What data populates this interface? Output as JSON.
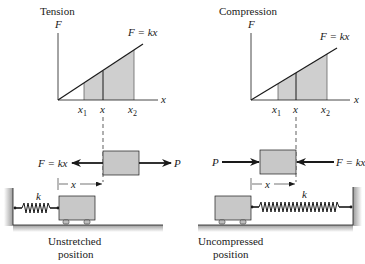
{
  "panels": [
    {
      "title": "Tension",
      "graph": {
        "y_axis_label": "F",
        "x_axis_label": "x",
        "line_label": "F = kx",
        "ticks": [
          "x",
          "x",
          "x"
        ],
        "tick_subscripts": [
          "1",
          "",
          "2"
        ]
      },
      "free_body": {
        "left_force_label": "F = kx",
        "right_force_label": "P",
        "displacement_label": "x"
      },
      "spring_label": "k",
      "caption_line1": "Unstretched",
      "caption_line2": "position"
    },
    {
      "title": "Compression",
      "graph": {
        "y_axis_label": "F",
        "x_axis_label": "x",
        "line_label": "F = kx",
        "ticks": [
          "x",
          "x",
          "x"
        ],
        "tick_subscripts": [
          "1",
          "",
          "2"
        ]
      },
      "free_body": {
        "left_force_label": "P",
        "right_force_label": "F = kx",
        "displacement_label": "x"
      },
      "spring_label": "k",
      "caption_line1": "Uncompressed",
      "caption_line2": "position"
    }
  ],
  "colors": {
    "ink": "#1a1a1a",
    "shade": "#cfcfcf",
    "block": "#c8c8c8",
    "ground": "#b5b5b5"
  }
}
